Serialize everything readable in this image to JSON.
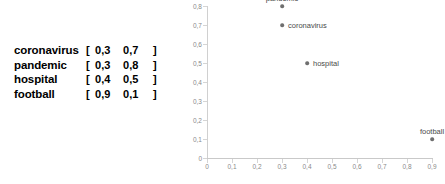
{
  "vector_table": {
    "open_bracket": "[",
    "close_bracket": "]",
    "rows": [
      {
        "word": "coronavirus",
        "x": "0,3",
        "y": "0,7"
      },
      {
        "word": "pandemic",
        "x": "0,3",
        "y": "0,8"
      },
      {
        "word": "hospital",
        "x": "0,4",
        "y": "0,5"
      },
      {
        "word": "football",
        "x": "0,9",
        "y": "0,1"
      }
    ]
  },
  "chart_data": {
    "type": "scatter",
    "title": "",
    "xlabel": "",
    "ylabel": "",
    "xlim": [
      0,
      0.9
    ],
    "ylim": [
      0,
      0.8
    ],
    "grid": false,
    "legend": "none",
    "point_color": "#6f6f6f",
    "axis_color": "#d0d0d0",
    "tick_label_color": "#8a8a8a",
    "point_label_color": "#4a4a4a",
    "xticks": [
      "0",
      "0,1",
      "0,2",
      "0,3",
      "0,4",
      "0,5",
      "0,6",
      "0,7",
      "0,8",
      "0,9"
    ],
    "xtick_values": [
      0,
      0.1,
      0.2,
      0.3,
      0.4,
      0.5,
      0.6,
      0.7,
      0.8,
      0.9
    ],
    "yticks": [
      "0",
      "0,1",
      "0,2",
      "0,3",
      "0,4",
      "0,5",
      "0,6",
      "0,7",
      "0,8"
    ],
    "ytick_values": [
      0,
      0.1,
      0.2,
      0.3,
      0.4,
      0.5,
      0.6,
      0.7,
      0.8
    ],
    "points": [
      {
        "label": "pandemic",
        "x": 0.3,
        "y": 0.8,
        "label_pos": "above"
      },
      {
        "label": "coronavirus",
        "x": 0.3,
        "y": 0.7,
        "label_pos": "right"
      },
      {
        "label": "hospital",
        "x": 0.4,
        "y": 0.5,
        "label_pos": "right"
      },
      {
        "label": "football",
        "x": 0.9,
        "y": 0.1,
        "label_pos": "above"
      }
    ]
  }
}
